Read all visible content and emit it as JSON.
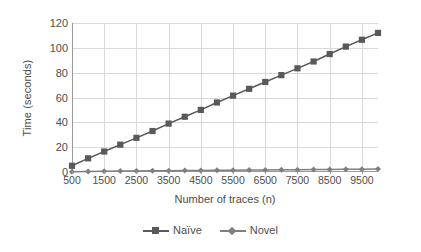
{
  "chart_data": {
    "type": "line",
    "title": "",
    "xlabel": "Number of traces (n)",
    "ylabel": "Time (seconds)",
    "xlim": [
      500,
      10000
    ],
    "ylim": [
      0,
      120
    ],
    "grid": true,
    "legend_position": "bottom",
    "x": [
      500,
      1000,
      1500,
      2000,
      2500,
      3000,
      3500,
      4000,
      4500,
      5000,
      5500,
      6000,
      6500,
      7000,
      7500,
      8000,
      8500,
      9000,
      9500,
      10000
    ],
    "x_tick_labels": [
      "500",
      "1500",
      "2500",
      "3500",
      "4500",
      "5500",
      "6500",
      "7500",
      "8500",
      "9500"
    ],
    "x_tick_values": [
      500,
      1500,
      2500,
      3500,
      4500,
      5500,
      6500,
      7500,
      8500,
      9500
    ],
    "y_tick_labels": [
      "0",
      "20",
      "40",
      "60",
      "80",
      "100",
      "120"
    ],
    "y_tick_values": [
      0,
      20,
      40,
      60,
      80,
      100,
      120
    ],
    "series": [
      {
        "name": "Naïve",
        "marker": "square",
        "color": "#595959",
        "values": [
          5,
          11,
          16.5,
          22,
          27.5,
          33,
          39,
          44.5,
          50,
          56,
          61.5,
          67,
          72.5,
          78,
          83.5,
          89,
          95,
          101,
          106.5,
          112
        ]
      },
      {
        "name": "Novel",
        "marker": "diamond",
        "color": "#7f7f7f",
        "values": [
          0.3,
          0.5,
          0.6,
          0.8,
          0.9,
          1.0,
          1.1,
          1.2,
          1.3,
          1.4,
          1.5,
          1.6,
          1.7,
          1.8,
          1.9,
          2.0,
          2.1,
          2.2,
          2.3,
          2.4
        ]
      }
    ]
  },
  "legend": {
    "items": [
      {
        "label": "Naïve"
      },
      {
        "label": "Novel"
      }
    ]
  },
  "colors": {
    "naive": "#595959",
    "novel": "#7f7f7f",
    "grid": "#d9d9d9",
    "axis": "#9a9a9a",
    "text": "#4d4d4d",
    "background": "#ffffff"
  }
}
